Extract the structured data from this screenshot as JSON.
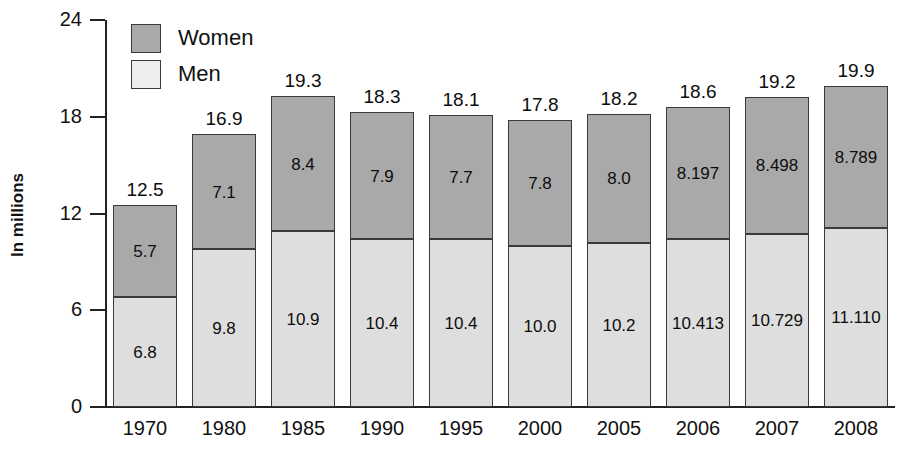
{
  "chart_data": {
    "type": "bar",
    "subtype": "stacked-bar",
    "title": "",
    "xlabel": "",
    "ylabel": "In millions",
    "ylim": [
      0,
      24
    ],
    "yticks": [
      0,
      6,
      12,
      18,
      24
    ],
    "ytick_labels": [
      "0",
      "6",
      "12",
      "18",
      "24"
    ],
    "grid": false,
    "legend_position": "top-left",
    "categories": [
      "1970",
      "1980",
      "1985",
      "1990",
      "1995",
      "2000",
      "2005",
      "2006",
      "2007",
      "2008"
    ],
    "series": [
      {
        "name": "Men",
        "color": "#dedede",
        "values": [
          6.8,
          9.8,
          10.9,
          10.4,
          10.4,
          10.0,
          10.2,
          10.413,
          10.729,
          11.11
        ],
        "labels": [
          "6.8",
          "9.8",
          "10.9",
          "10.4",
          "10.4",
          "10.0",
          "10.2",
          "10.413",
          "10.729",
          "11.110"
        ]
      },
      {
        "name": "Women",
        "color": "#a9a9a9",
        "values": [
          5.7,
          7.1,
          8.4,
          7.9,
          7.7,
          7.8,
          8.0,
          8.197,
          8.498,
          8.789
        ],
        "labels": [
          "5.7",
          "7.1",
          "8.4",
          "7.9",
          "7.7",
          "7.8",
          "8.0",
          "8.197",
          "8.498",
          "8.789"
        ]
      }
    ],
    "totals": [
      12.5,
      16.9,
      19.3,
      18.3,
      18.1,
      17.8,
      18.2,
      18.6,
      19.2,
      19.9
    ],
    "total_labels": [
      "12.5",
      "16.9",
      "19.3",
      "18.3",
      "18.1",
      "17.8",
      "18.2",
      "18.6",
      "19.2",
      "19.9"
    ]
  },
  "legend": {
    "items": [
      {
        "label": "Women",
        "color": "#a9a9a9"
      },
      {
        "label": "Men",
        "color": "#ededed"
      }
    ]
  },
  "axis": {
    "y_title": "In millions",
    "y_ticks": [
      "24",
      "18",
      "12",
      "6",
      "0"
    ],
    "x_ticks": [
      "1970",
      "1980",
      "1985",
      "1990",
      "1995",
      "2000",
      "2005",
      "2006",
      "2007",
      "2008"
    ]
  },
  "colors": {
    "women_fill": "#a9a9a9",
    "men_fill": "#dedede",
    "outline": "#3a3a3a",
    "axis": "#222222",
    "text": "#111111",
    "background": "#ffffff"
  }
}
